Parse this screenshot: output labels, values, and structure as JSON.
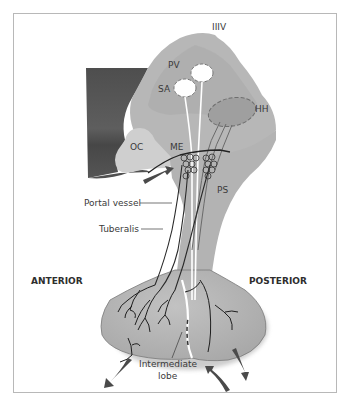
{
  "diagram": {
    "type": "anatomical-illustration",
    "labels": {
      "third_ventricle": "IIIV",
      "paraventricular": "PV",
      "supraoptic": "SA",
      "hypothalamic_hh": "HH",
      "optic_chiasm": "OC",
      "median_eminence": "ME",
      "pituitary_stalk": "PS",
      "portal_vessel": "Portal vessel",
      "tuberalis": "Tuberalis",
      "anterior": "ANTERIOR",
      "posterior": "POSTERIOR",
      "intermediate_line1": "Intermediate",
      "intermediate_line2": "lobe"
    },
    "colors": {
      "frame_border": "#b8b8b8",
      "hypothalamus_fill": "#b9b9b9",
      "hypothalamus_dark": "#a6a6a6",
      "brain_dark": "#595959",
      "oc_fill": "#cfcfcf",
      "gland_fill": "#b3b3b3",
      "arrow_color": "#4a4a4a",
      "line_color": "#222222"
    }
  }
}
